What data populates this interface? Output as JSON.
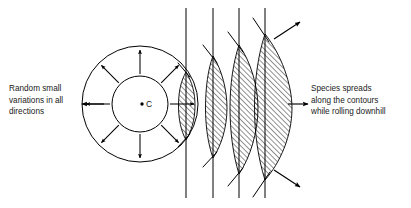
{
  "figure": {
    "background_color": "#ffffff",
    "stroke_color": "#000000",
    "hatch_color": "#000000",
    "width": 411,
    "height": 208
  },
  "captions": {
    "left": "Random small\nvariations in all\ndirections",
    "right": "Species spreads\nalong the contours\nwhile rolling downhill"
  },
  "center": {
    "label": "C",
    "dot_x": 142,
    "dot_y": 104
  },
  "circles": {
    "center_x": 140,
    "center_y": 104,
    "outer_radius": 58,
    "inner_radius": 28
  },
  "radial_arrows": {
    "count": 8,
    "angles_deg": [
      0,
      45,
      90,
      135,
      180,
      225,
      270,
      315
    ],
    "inner_start_radius": 30,
    "outer_end_radius": 56,
    "description": "eight arrows pointing radially outward between inner and outer circle"
  },
  "contour_lines": {
    "count": 4,
    "x_positions": [
      186,
      213,
      239,
      265
    ],
    "y_top": 8,
    "y_bottom": 198,
    "description": "four vertical contour lines, evenly spaced, representing a slope"
  },
  "lens_shapes": [
    {
      "index": 1,
      "line_x": 186,
      "top_y": 72,
      "bottom_y": 140,
      "bulge": 9,
      "hatched": true
    },
    {
      "index": 2,
      "line_x": 213,
      "top_y": 56,
      "bottom_y": 158,
      "bulge": 14,
      "hatched": true
    },
    {
      "index": 3,
      "line_x": 239,
      "top_y": 45,
      "bottom_y": 174,
      "bulge": 19,
      "hatched": true
    },
    {
      "index": 4,
      "line_x": 265,
      "top_y": 34,
      "bottom_y": 180,
      "bulge": 27,
      "hatched": true
    }
  ],
  "diagonal_strokes": {
    "description": "slanted chord lines crossing each contour line at the lens ends",
    "count": 4
  },
  "pointer_arrows": [
    {
      "name": "left-caption-arrow",
      "from_x": 82,
      "from_y": 104,
      "to_x": 104,
      "to_y": 104,
      "direction": "left"
    },
    {
      "name": "right-caption-arrow",
      "from_x": 305,
      "from_y": 104,
      "to_x": 288,
      "to_y": 104,
      "direction": "right"
    },
    {
      "name": "upper-right-spread-arrow",
      "from_x": 278,
      "from_y": 36,
      "to_x": 300,
      "to_y": 22,
      "direction": "up-right"
    },
    {
      "name": "lower-right-spread-arrow",
      "from_x": 278,
      "from_y": 172,
      "to_x": 300,
      "to_y": 186,
      "direction": "down-right"
    }
  ],
  "hatching": {
    "angle_deg": 45,
    "spacing_px": 2.6,
    "line_width": 0.7
  }
}
